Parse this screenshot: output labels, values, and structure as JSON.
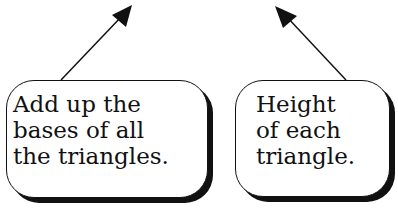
{
  "callouts": [
    {
      "id": "bases",
      "lines": [
        "Add up the",
        "bases of all",
        "the triangles."
      ],
      "arrow": {
        "from": [
          61,
          80
        ],
        "to": [
          131,
          6
        ]
      }
    },
    {
      "id": "height",
      "lines": [
        "Height",
        "of each",
        "triangle."
      ],
      "arrow": {
        "from": [
          346,
          80
        ],
        "to": [
          276,
          7
        ]
      }
    }
  ],
  "colors": {
    "ink": "#111111",
    "background": "#ffffff"
  }
}
